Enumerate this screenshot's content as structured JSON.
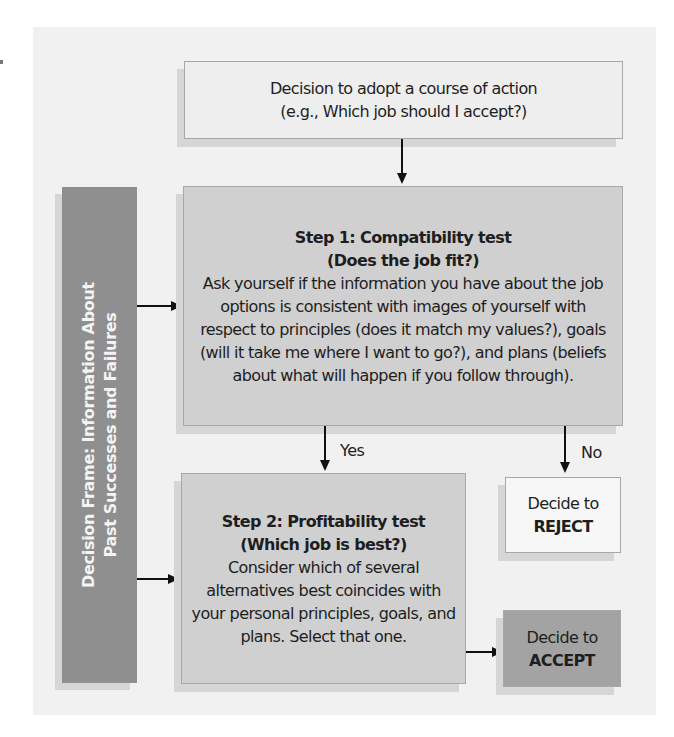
{
  "diagram": {
    "top_box": {
      "line1": "Decision to adopt a course of action",
      "line2": "(e.g., Which job should I accept?)"
    },
    "decision_frame": {
      "line1": "Decision Frame: Information About",
      "line2": "Past Successes and Failures"
    },
    "step1": {
      "title": "Step 1: Compatibility test",
      "subtitle": "(Does the job fit?)",
      "body": "Ask yourself if the information you have about the job options is consistent with images of yourself with respect to principles (does it match my values?), goals (will it take me where I want to go?), and plans (beliefs about what will happen if you follow through)."
    },
    "step2": {
      "title": "Step 2: Profitability test",
      "subtitle": "(Which job is best?)",
      "body": "Consider which of several alternatives best coincides with your personal principles, goals, and plans. Select that one."
    },
    "reject": {
      "line1": "Decide to",
      "line2": "REJECT"
    },
    "accept": {
      "line1": "Decide to",
      "line2": "ACCEPT"
    },
    "edge_labels": {
      "yes": "Yes",
      "no": "No"
    },
    "colors": {
      "panel": "#f1f1f1",
      "top_box": "#eeeeee",
      "step_box": "#d0d0d0",
      "reject_box": "#f7f7f7",
      "accept_box": "#a3a3a3",
      "frame_box": "#8f8f8f"
    }
  }
}
